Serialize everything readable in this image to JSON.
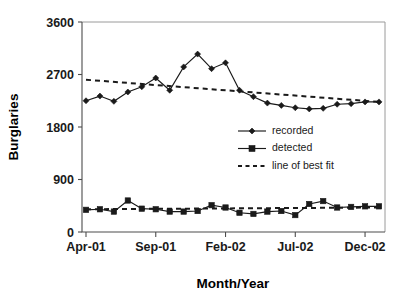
{
  "chart_data": {
    "type": "line",
    "title": "",
    "xlabel": "Month/Year",
    "ylabel": "Burglaries",
    "ylim": [
      0,
      3600
    ],
    "yticks": [
      0,
      900,
      1800,
      2700,
      3600
    ],
    "ytick_labels": [
      "0",
      "900",
      "1800",
      "2700",
      "3600"
    ],
    "grid": false,
    "legend_position": "inside-center-right",
    "x": [
      "Apr-01",
      "May-01",
      "Jun-01",
      "Jul-01",
      "Aug-01",
      "Sep-01",
      "Oct-01",
      "Nov-01",
      "Dec-01",
      "Jan-02",
      "Feb-02",
      "Mar-02",
      "Apr-02",
      "May-02",
      "Jun-02",
      "Jul-02",
      "Aug-02",
      "Sep-02",
      "Oct-02",
      "Nov-02",
      "Dec-02",
      "Jan-03"
    ],
    "xtick_labels": [
      "Apr-01",
      "Sep-01",
      "Feb-02",
      "Jul-02",
      "Dec-02"
    ],
    "xtick_indices": [
      0,
      5,
      10,
      15,
      20
    ],
    "series": [
      {
        "name": "recorded",
        "marker": "diamond",
        "values": [
          2250,
          2330,
          2240,
          2400,
          2490,
          2640,
          2430,
          2830,
          3050,
          2800,
          2900,
          2430,
          2320,
          2210,
          2170,
          2130,
          2110,
          2120,
          2190,
          2200,
          2230,
          2230
        ]
      },
      {
        "name": "detected",
        "marker": "square",
        "values": [
          380,
          390,
          350,
          540,
          400,
          390,
          350,
          350,
          360,
          460,
          420,
          330,
          310,
          350,
          360,
          290,
          480,
          530,
          420,
          430,
          440,
          440
        ]
      }
    ],
    "trend_lines": [
      {
        "name": "line of best fit",
        "for_series": "recorded",
        "start_value": 2610,
        "end_value": 2230,
        "style": "dashed"
      },
      {
        "name": "line of best fit",
        "for_series": "detected",
        "start_value": 390,
        "end_value": 420,
        "style": "dashed"
      }
    ],
    "legend": [
      {
        "label": "recorded",
        "marker": "diamond",
        "style": "solid-line"
      },
      {
        "label": "detected",
        "marker": "square",
        "style": "solid-line"
      },
      {
        "label": "line of best fit",
        "marker": "none",
        "style": "dashed-line"
      }
    ]
  },
  "colors": {
    "series": "#1a1a1a",
    "axis": "#4d4d4d",
    "border": "#9a9a9a",
    "background": "#ffffff"
  }
}
